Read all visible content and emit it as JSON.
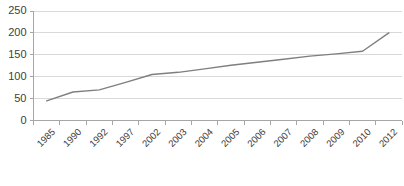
{
  "chart_data": {
    "type": "line",
    "title": "",
    "subtitle": "",
    "xlabel": "",
    "ylabel": "",
    "categories": [
      "1985",
      "1990",
      "1992",
      "1997",
      "2002",
      "2003",
      "2004",
      "2005",
      "2006",
      "2007",
      "2008",
      "2009",
      "2010",
      "2012"
    ],
    "series": [
      {
        "name": "",
        "color": "#7f7f7f",
        "values": [
          45,
          65,
          70,
          87,
          105,
          110,
          118,
          126,
          133,
          140,
          147,
          152,
          158,
          200
        ]
      }
    ],
    "ylim": [
      0,
      250
    ],
    "yticks": [
      0,
      50,
      100,
      150,
      200,
      250
    ],
    "ytick_labels": [
      "0",
      "50",
      "100",
      "150",
      "200",
      "250"
    ],
    "grid": true,
    "grid_axis": "y",
    "legend": false,
    "legend_position": "none",
    "markers": false,
    "annotations": []
  },
  "axes": {
    "y_axis_color": "#a6a6a6",
    "x_axis_color": "#a6a6a6",
    "gridline_color": "#d9d9d9",
    "tick_label_color": "#404040"
  },
  "plot_background": "#ffffff"
}
